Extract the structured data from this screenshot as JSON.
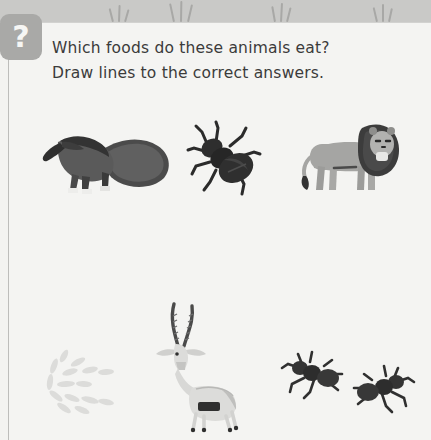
{
  "worksheet": {
    "badge": {
      "icon": "question-mark-icon",
      "label": "?"
    },
    "prompt": {
      "line1": "Which foods do these animals eat?",
      "line2": "Draw lines to the correct answers."
    },
    "colors": {
      "page_background": "#f3f3f1",
      "card_background": "#f4f4f2",
      "top_band": "#c9c9c7",
      "badge": "#a9a9a7",
      "badge_text": "#f6f6f4",
      "text": "#3b3b3b",
      "anteater_dark": "#3a3a3a",
      "anteater_mid": "#5c5c5c",
      "beetle": "#2e2e2e",
      "lion_body": "#a5a5a3",
      "lion_mane": "#3c3c3c",
      "gazelle_body": "#d8d8d6",
      "gazelle_horn": "#4a4a4a",
      "ant": "#343434",
      "seeds": "#dedede"
    },
    "decoration": {
      "grass_tufts": [
        {
          "x": 108,
          "blades": 3
        },
        {
          "x": 170,
          "blades": 3
        },
        {
          "x": 270,
          "blades": 3
        },
        {
          "x": 372,
          "blades": 3
        }
      ]
    },
    "animals": [
      {
        "id": "anteater",
        "name": "Anteater",
        "row": "top",
        "x": 42,
        "y": 124,
        "w": 130,
        "h": 70
      },
      {
        "id": "beetle",
        "name": "Beetle",
        "row": "top",
        "x": 186,
        "y": 120,
        "w": 76,
        "h": 76
      },
      {
        "id": "lion",
        "name": "Lion",
        "row": "top",
        "x": 300,
        "y": 114,
        "w": 100,
        "h": 80
      }
    ],
    "foods": [
      {
        "id": "seeds",
        "name": "Seeds",
        "row": "bottom",
        "x": 40,
        "y": 350,
        "w": 80,
        "h": 62
      },
      {
        "id": "gazelle",
        "name": "Gazelle",
        "row": "bottom",
        "x": 148,
        "y": 302,
        "w": 90,
        "h": 128
      },
      {
        "id": "ants",
        "name": "Ants",
        "row": "bottom",
        "x": 278,
        "y": 352,
        "w": 136,
        "h": 62
      }
    ]
  }
}
